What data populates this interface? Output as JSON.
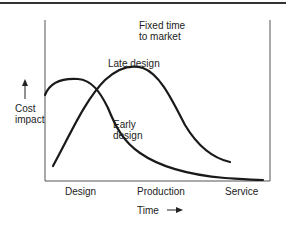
{
  "diagram": {
    "annotation": {
      "line1": "Fixed time",
      "line2": "to market"
    },
    "y_axis": {
      "label_line1": "Cost",
      "label_line2": "impact",
      "arrow": "up-arrow"
    },
    "x_axis": {
      "label": "Time",
      "arrow": "right-arrow",
      "phases": [
        "Design",
        "Production",
        "Service"
      ]
    },
    "curves": [
      {
        "name": "Late design",
        "label": "Late design"
      },
      {
        "name": "Early design",
        "label_line1": "Early",
        "label_line2": "design"
      }
    ],
    "colors": {
      "ink": "#1a1a1a",
      "frame": "#444444",
      "background": "#ffffff"
    }
  }
}
